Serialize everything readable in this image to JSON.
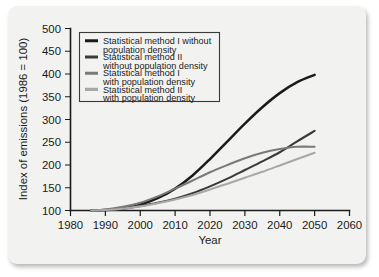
{
  "chart_data": {
    "type": "line",
    "title": "",
    "xlabel": "Year",
    "ylabel": "Index of emissions (1986 = 100)",
    "xlim": [
      1980,
      2060
    ],
    "ylim": [
      100,
      500
    ],
    "xticks": [
      1980,
      1990,
      2000,
      2010,
      2020,
      2030,
      2040,
      2050,
      2060
    ],
    "yticks": [
      100,
      150,
      200,
      250,
      300,
      350,
      400,
      450,
      500
    ],
    "grid": false,
    "legend_position": "top-left",
    "x": [
      1986,
      1990,
      1995,
      2000,
      2005,
      2010,
      2015,
      2020,
      2025,
      2030,
      2035,
      2040,
      2045,
      2050
    ],
    "series": [
      {
        "name": "Statistical method I without population density",
        "color": "#1b1b1b",
        "values": [
          100,
          101,
          105,
          113,
          127,
          148,
          177,
          213,
          252,
          291,
          327,
          358,
          382,
          398
        ]
      },
      {
        "name": "Statistical method II without population density",
        "color": "#3a3a3a",
        "values": [
          100,
          101,
          104,
          110,
          117,
          126,
          138,
          153,
          170,
          189,
          208,
          228,
          252,
          275
        ]
      },
      {
        "name": "Statistical method I with population density",
        "color": "#7a7a7a",
        "values": [
          100,
          102,
          108,
          117,
          131,
          148,
          166,
          184,
          200,
          215,
          227,
          235,
          240,
          240
        ]
      },
      {
        "name": "Statistical method II with population density",
        "color": "#a8a8a8",
        "values": [
          100,
          101,
          104,
          109,
          116,
          124,
          134,
          146,
          159,
          172,
          185,
          199,
          213,
          227
        ]
      }
    ]
  },
  "legend": {
    "entries": [
      {
        "line1": "Statistical method I without",
        "line2": "population density"
      },
      {
        "line1": "Statistical method II",
        "line2": "without population density"
      },
      {
        "line1": "Statistical method I",
        "line2": "with population density"
      },
      {
        "line1": "Statistical method II",
        "line2": "with population density"
      }
    ]
  },
  "axes": {
    "x_title": "Year",
    "y_title": "Index of emissions (1986 = 100)",
    "x_tick_labels": [
      "1980",
      "1990",
      "2000",
      "2010",
      "2020",
      "2030",
      "2040",
      "2050",
      "2060"
    ],
    "y_tick_labels": [
      "100",
      "150",
      "200",
      "250",
      "300",
      "350",
      "400",
      "450",
      "500"
    ]
  },
  "colors": {
    "series_1": "#1b1b1b",
    "series_2": "#3a3a3a",
    "series_3": "#7a7a7a",
    "series_4": "#a8a8a8",
    "card_background": "#f2f2f0",
    "axis": "#1b1b1b"
  }
}
